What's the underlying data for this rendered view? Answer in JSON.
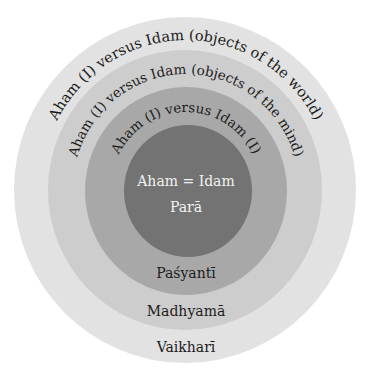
{
  "diagram": {
    "type": "concentric-circles",
    "rings": [
      {
        "id": "vaikhari",
        "label": "Vaikharī",
        "arc_text": "Aham (I) versus Idam (objects of the world)",
        "color": "#e2e2e2"
      },
      {
        "id": "madhyama",
        "label": "Madhyamā",
        "arc_text": "Aham (I) versus Idam (objects of the mind)",
        "color": "#cdcdcd"
      },
      {
        "id": "pasyanti",
        "label": "Paśyantī",
        "arc_text": "Aham (I) versus Idam (I)",
        "color": "#a8a8a8"
      },
      {
        "id": "para",
        "label": "Parā",
        "center_text": "Aham = Idam",
        "color": "#737373"
      }
    ]
  }
}
